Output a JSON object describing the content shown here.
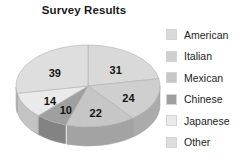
{
  "chart_data": {
    "type": "pie",
    "title": "Survey Results",
    "xlabel": "",
    "ylabel": "",
    "legend_position": "right",
    "grid": false,
    "three_d": true,
    "total": 140,
    "categories": [
      "American",
      "Italian",
      "Mexican",
      "Chinese",
      "Japanese",
      "Other"
    ],
    "values": [
      31,
      24,
      22,
      10,
      14,
      39
    ],
    "colors": [
      "#d9d9d9",
      "#cfcfcf",
      "#c6c6c6",
      "#9f9f9f",
      "#eaeaea",
      "#dedede"
    ],
    "side_colors": [
      "#b4b4b4",
      "#ababab",
      "#a3a3a3",
      "#838383",
      "#c3c3c3",
      "#b9b9b9"
    ],
    "data_labels": [
      "31",
      "24",
      "22",
      "10",
      "14",
      "39"
    ],
    "slices": [
      {
        "label": "American",
        "value": 31,
        "data_label": "31",
        "color": "#d9d9d9"
      },
      {
        "label": "Italian",
        "value": 24,
        "data_label": "24",
        "color": "#cfcfcf"
      },
      {
        "label": "Mexican",
        "value": 22,
        "data_label": "22",
        "color": "#c6c6c6"
      },
      {
        "label": "Chinese",
        "value": 10,
        "data_label": "10",
        "color": "#9f9f9f"
      },
      {
        "label": "Japanese",
        "value": 14,
        "data_label": "14",
        "color": "#eaeaea"
      },
      {
        "label": "Other",
        "value": 39,
        "data_label": "39",
        "color": "#dedede"
      }
    ]
  },
  "legend": {
    "items": [
      {
        "label": "American",
        "color": "#d9d9d9"
      },
      {
        "label": "Italian",
        "color": "#cfcfcf"
      },
      {
        "label": "Mexican",
        "color": "#c6c6c6"
      },
      {
        "label": "Chinese",
        "color": "#9f9f9f"
      },
      {
        "label": "Japanese",
        "color": "#eaeaea"
      },
      {
        "label": "Other",
        "color": "#dedede"
      }
    ]
  }
}
